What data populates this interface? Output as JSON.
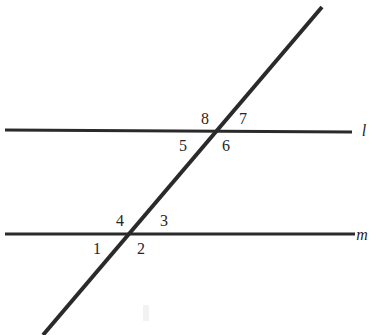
{
  "figure": {
    "background_color": "#ffffff",
    "stroke_color": "#2a2a2a",
    "label_color": "#262626",
    "line_width_px": 3,
    "transversal_width_px": 4
  },
  "lines": {
    "l": {
      "name": "l",
      "x1": 5,
      "y1": 130,
      "x2": 352,
      "y2": 132,
      "label_x": 364,
      "label_y": 136
    },
    "m": {
      "name": "m",
      "x1": 5,
      "y1": 234,
      "x2": 355,
      "y2": 234,
      "label_x": 362,
      "label_y": 240
    },
    "transversal": {
      "name": "",
      "x1": 322,
      "y1": 7,
      "x2": 43,
      "y2": 335
    }
  },
  "intersections": {
    "upper": {
      "x": 216,
      "y": 131,
      "on_line": "l"
    },
    "lower": {
      "x": 131,
      "y": 234,
      "on_line": "m"
    }
  },
  "angle_labels": [
    {
      "id": "1",
      "text": "1",
      "x": 97,
      "y": 254,
      "vertex": "lower",
      "position": "lower-left"
    },
    {
      "id": "2",
      "text": "2",
      "x": 141,
      "y": 254,
      "vertex": "lower",
      "position": "lower-right"
    },
    {
      "id": "3",
      "text": "3",
      "x": 164,
      "y": 226,
      "vertex": "lower",
      "position": "upper-right"
    },
    {
      "id": "4",
      "text": "4",
      "x": 120,
      "y": 226,
      "vertex": "lower",
      "position": "upper-left"
    },
    {
      "id": "5",
      "text": "5",
      "x": 183,
      "y": 151,
      "vertex": "upper",
      "position": "lower-left"
    },
    {
      "id": "6",
      "text": "6",
      "x": 226,
      "y": 151,
      "vertex": "upper",
      "position": "lower-right"
    },
    {
      "id": "7",
      "text": "7",
      "x": 243,
      "y": 124,
      "vertex": "upper",
      "position": "upper-right"
    },
    {
      "id": "8",
      "text": "8",
      "x": 205,
      "y": 124,
      "vertex": "upper",
      "position": "upper-left"
    }
  ],
  "artifacts": {
    "scan_smudge": {
      "x": 143,
      "y": 305,
      "width": 6,
      "height": 16
    }
  }
}
